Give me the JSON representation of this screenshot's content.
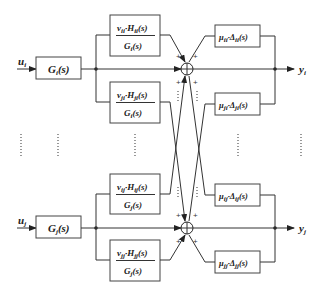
{
  "diagram": {
    "type": "block-diagram",
    "loops": [
      {
        "id": "i",
        "input_label": "u",
        "input_sub": "i",
        "output_label": "y",
        "output_sub": "i",
        "plant": {
          "name": "G",
          "sub": "i",
          "arg": "(s)"
        },
        "upper_filter": {
          "num_v": "v",
          "num_v_sub": "ii",
          "num_h": "H",
          "num_h_sub": "ii",
          "den": "G",
          "den_sub": "i",
          "arg": "(s)"
        },
        "lower_filter": {
          "num_v": "v",
          "num_v_sub": "ji",
          "num_h": "H",
          "num_h_sub": "ji",
          "den": "G",
          "den_sub": "i",
          "arg": "(s)"
        },
        "upper_uncertainty": {
          "mu": "μ",
          "mu_sub": "ii",
          "delta": "Δ",
          "delta_sub": "ii",
          "arg": "(s)"
        },
        "lower_uncertainty": {
          "mu": "μ",
          "mu_sub": "ji",
          "delta": "Δ",
          "delta_sub": "ji",
          "arg": "(s)"
        },
        "sum_signs": [
          "+",
          "+",
          "+",
          "+"
        ]
      },
      {
        "id": "j",
        "input_label": "u",
        "input_sub": "j",
        "output_label": "y",
        "output_sub": "j",
        "plant": {
          "name": "G",
          "sub": "j",
          "arg": "(s)"
        },
        "upper_filter": {
          "num_v": "v",
          "num_v_sub": "ij",
          "num_h": "H",
          "num_h_sub": "ij",
          "den": "G",
          "den_sub": "j",
          "arg": "(s)"
        },
        "lower_filter": {
          "num_v": "v",
          "num_v_sub": "jj",
          "num_h": "H",
          "num_h_sub": "jj",
          "den": "G",
          "den_sub": "j",
          "arg": "(s)"
        },
        "upper_uncertainty": {
          "mu": "μ",
          "mu_sub": "ij",
          "delta": "Δ",
          "delta_sub": "ij",
          "arg": "(s)"
        },
        "lower_uncertainty": {
          "mu": "μ",
          "mu_sub": "jj",
          "delta": "Δ",
          "delta_sub": "jj",
          "arg": "(s)"
        },
        "sum_signs": [
          "+",
          "+",
          "+",
          "+"
        ]
      }
    ],
    "ellipsis": "⋮",
    "dot_operator": "·"
  }
}
